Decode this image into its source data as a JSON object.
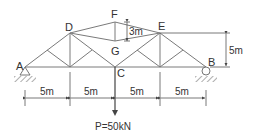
{
  "diagram": {
    "type": "truss",
    "nodes": {
      "A": {
        "label": "A",
        "support": "pin"
      },
      "B": {
        "label": "B",
        "support": "roller"
      },
      "C": {
        "label": "C"
      },
      "D": {
        "label": "D"
      },
      "E": {
        "label": "E"
      },
      "F": {
        "label": "F"
      },
      "G": {
        "label": "G"
      }
    },
    "dimensions": {
      "spans": [
        "5m",
        "5m",
        "5m",
        "5m"
      ],
      "height": "5m",
      "fg_height": "3m"
    },
    "load": {
      "label": "P=50kN",
      "node": "C",
      "direction": "down"
    },
    "colors": {
      "members": "#7a7a7a",
      "text": "#333333",
      "dimension": "#555555"
    }
  }
}
